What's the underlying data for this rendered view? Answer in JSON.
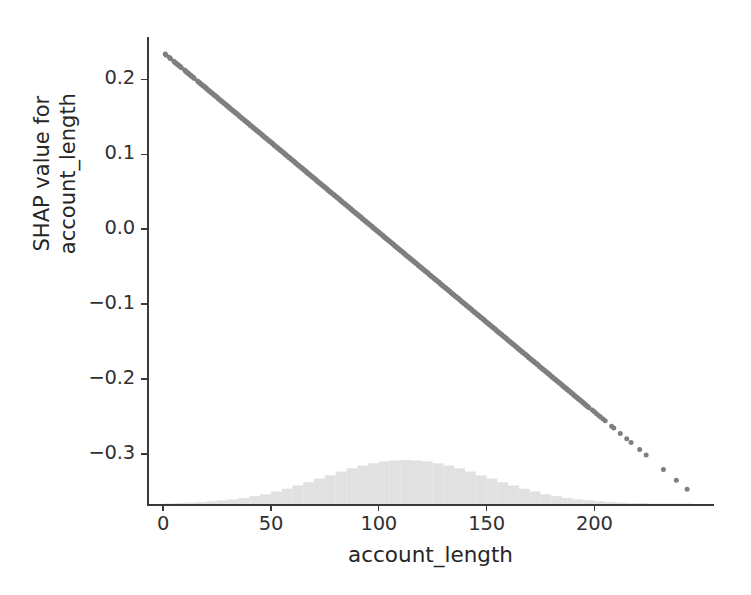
{
  "figure": {
    "background_color": "#ffffff",
    "point_color": "#7f7f7f",
    "histogram_color": "#dcdcdc",
    "axis_color": "#3a3a3a",
    "width": 751,
    "height": 595
  },
  "chart_data": {
    "type": "scatter",
    "title": "",
    "xlabel": "account_length",
    "ylabel": "SHAP value for\naccount_length",
    "ylabel_lines": [
      "SHAP value for",
      "account_length"
    ],
    "xlim": [
      -7,
      255
    ],
    "ylim": [
      -0.368,
      0.2565
    ],
    "xticks": [
      0,
      50,
      100,
      150,
      200
    ],
    "xticklabels": [
      "0",
      "50",
      "100",
      "150",
      "200"
    ],
    "yticks": [
      0.2,
      0.1,
      0.0,
      -0.1,
      -0.2,
      -0.3
    ],
    "yticklabels": [
      "0.2",
      "0.1",
      "0.0",
      "−0.1",
      "−0.2",
      "−0.3"
    ],
    "grid": false,
    "legend": null,
    "series": [
      {
        "name": "SHAP value for account_length",
        "marker": "circle",
        "color": "#7f7f7f",
        "marker_size": 5,
        "relationship": "linear decreasing",
        "approx_fit": {
          "intercept": 0.2363,
          "slope": -0.002399
        },
        "x": [
          1,
          3,
          5,
          6,
          7,
          8,
          10,
          11,
          12,
          13,
          14,
          16,
          17,
          18,
          19,
          20,
          21,
          22,
          23,
          24,
          25,
          26,
          27,
          28,
          29,
          30,
          31,
          32,
          33,
          34,
          35,
          36,
          37,
          38,
          39,
          40,
          41,
          42,
          43,
          44,
          45,
          46,
          47,
          48,
          49,
          50,
          51,
          52,
          53,
          54,
          55,
          56,
          57,
          58,
          59,
          60,
          61,
          62,
          63,
          64,
          65,
          66,
          67,
          68,
          69,
          70,
          71,
          72,
          73,
          74,
          75,
          76,
          77,
          78,
          79,
          80,
          81,
          82,
          83,
          84,
          85,
          86,
          87,
          88,
          89,
          90,
          91,
          92,
          93,
          94,
          95,
          96,
          97,
          98,
          99,
          100,
          101,
          102,
          103,
          104,
          105,
          106,
          107,
          108,
          109,
          110,
          111,
          112,
          113,
          114,
          115,
          116,
          117,
          118,
          119,
          120,
          121,
          122,
          123,
          124,
          125,
          126,
          127,
          128,
          129,
          130,
          131,
          132,
          133,
          134,
          135,
          136,
          137,
          138,
          139,
          140,
          141,
          142,
          143,
          144,
          145,
          146,
          147,
          148,
          149,
          150,
          151,
          152,
          153,
          154,
          155,
          156,
          157,
          158,
          159,
          160,
          161,
          162,
          163,
          164,
          165,
          166,
          167,
          168,
          169,
          170,
          171,
          172,
          173,
          174,
          175,
          176,
          177,
          178,
          179,
          180,
          181,
          182,
          183,
          184,
          185,
          186,
          187,
          188,
          189,
          190,
          191,
          192,
          193,
          194,
          195,
          196,
          197,
          199,
          200,
          201,
          202,
          203,
          204,
          205,
          208,
          209,
          212,
          215,
          217,
          221,
          224,
          232,
          238,
          243
        ],
        "y": [
          0.2339,
          0.2291,
          0.2243,
          0.2219,
          0.2195,
          0.2171,
          0.2123,
          0.2099,
          0.2075,
          0.2051,
          0.2027,
          0.1979,
          0.1955,
          0.1931,
          0.1907,
          0.1883,
          0.1859,
          0.1835,
          0.1811,
          0.1787,
          0.1763,
          0.1739,
          0.1715,
          0.1691,
          0.1667,
          0.1643,
          0.1619,
          0.1595,
          0.1571,
          0.1547,
          0.1523,
          0.1499,
          0.1475,
          0.1451,
          0.1427,
          0.1403,
          0.1379,
          0.1355,
          0.1331,
          0.1307,
          0.1283,
          0.1259,
          0.1235,
          0.1211,
          0.1187,
          0.1163,
          0.1139,
          0.1115,
          0.1091,
          0.1067,
          0.1043,
          0.1019,
          0.0995,
          0.0971,
          0.0947,
          0.0923,
          0.0899,
          0.0875,
          0.0851,
          0.0827,
          0.0803,
          0.0779,
          0.0755,
          0.0731,
          0.0707,
          0.0683,
          0.0659,
          0.0635,
          0.0611,
          0.0587,
          0.0563,
          0.0539,
          0.0515,
          0.0491,
          0.0467,
          0.0443,
          0.0419,
          0.0395,
          0.0371,
          0.0347,
          0.0323,
          0.0299,
          0.0275,
          0.0251,
          0.0227,
          0.0203,
          0.0179,
          0.0155,
          0.0131,
          0.0107,
          0.0083,
          0.0059,
          0.0035,
          0.0011,
          -0.0013,
          -0.0037,
          -0.0061,
          -0.0085,
          -0.0109,
          -0.0133,
          -0.0157,
          -0.0181,
          -0.0205,
          -0.0229,
          -0.0253,
          -0.0277,
          -0.0301,
          -0.0325,
          -0.0349,
          -0.0373,
          -0.0397,
          -0.0421,
          -0.0445,
          -0.0469,
          -0.0493,
          -0.0517,
          -0.0541,
          -0.0565,
          -0.0589,
          -0.0613,
          -0.0637,
          -0.0661,
          -0.0685,
          -0.0709,
          -0.0733,
          -0.0757,
          -0.0781,
          -0.0805,
          -0.0829,
          -0.0853,
          -0.0877,
          -0.0901,
          -0.0925,
          -0.0949,
          -0.0973,
          -0.0997,
          -0.1021,
          -0.1045,
          -0.1069,
          -0.1093,
          -0.1117,
          -0.1141,
          -0.1165,
          -0.1189,
          -0.1213,
          -0.1237,
          -0.1261,
          -0.1285,
          -0.1309,
          -0.1333,
          -0.1357,
          -0.1381,
          -0.1405,
          -0.1429,
          -0.1453,
          -0.1477,
          -0.1501,
          -0.1525,
          -0.1549,
          -0.1573,
          -0.1597,
          -0.1621,
          -0.1645,
          -0.1669,
          -0.1693,
          -0.1717,
          -0.1741,
          -0.1765,
          -0.1789,
          -0.1813,
          -0.1837,
          -0.1861,
          -0.1885,
          -0.1909,
          -0.1933,
          -0.1957,
          -0.1981,
          -0.2005,
          -0.2029,
          -0.2053,
          -0.2077,
          -0.2101,
          -0.2125,
          -0.2149,
          -0.2173,
          -0.2197,
          -0.2221,
          -0.2245,
          -0.2269,
          -0.2293,
          -0.2317,
          -0.2341,
          -0.2365,
          -0.2413,
          -0.2437,
          -0.2461,
          -0.2485,
          -0.2509,
          -0.2533,
          -0.2557,
          -0.2629,
          -0.2653,
          -0.2725,
          -0.2797,
          -0.2845,
          -0.2941,
          -0.3013,
          -0.3205,
          -0.3349,
          -0.3469
        ]
      }
    ],
    "histogram": {
      "description": "faint light-gray density of account_length along the bottom of the axes",
      "color": "#dcdcdc",
      "bin_width": 5,
      "bin_starts": [
        0,
        5,
        10,
        15,
        20,
        25,
        30,
        35,
        40,
        45,
        50,
        55,
        60,
        65,
        70,
        75,
        80,
        85,
        90,
        95,
        100,
        105,
        110,
        115,
        120,
        125,
        130,
        135,
        140,
        145,
        150,
        155,
        160,
        165,
        170,
        175,
        180,
        185,
        190,
        195,
        200,
        205,
        210,
        215,
        220,
        225,
        230,
        235,
        240
      ],
      "counts": [
        1,
        2,
        3,
        4,
        6,
        8,
        10,
        13,
        17,
        21,
        27,
        33,
        40,
        47,
        55,
        62,
        70,
        77,
        83,
        88,
        92,
        94,
        95,
        94,
        92,
        88,
        83,
        77,
        70,
        62,
        55,
        47,
        40,
        33,
        27,
        21,
        17,
        13,
        10,
        8,
        6,
        4,
        3,
        2,
        2,
        1,
        1,
        1,
        1
      ]
    }
  }
}
